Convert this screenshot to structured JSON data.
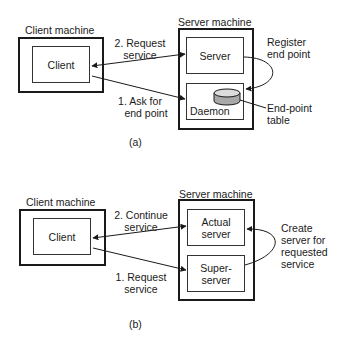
{
  "panel_a": {
    "caption": "(a)",
    "client_machine": {
      "label": "Client machine",
      "inner": "Client"
    },
    "server_machine": {
      "label": "Server machine",
      "top_box": "Server",
      "bottom_box": "Daemon"
    },
    "arrows": {
      "top_line1": "2. Request",
      "top_line2": "service",
      "bottom_line1": "1. Ask for",
      "bottom_line2": "end point"
    },
    "annotations": {
      "register_line1": "Register",
      "register_line2": "end point",
      "table_line1": "End-point",
      "table_line2": "table"
    }
  },
  "panel_b": {
    "caption": "(b)",
    "client_machine": {
      "label": "Client machine",
      "inner": "Client"
    },
    "server_machine": {
      "label": "Server machine",
      "top_line1": "Actual",
      "top_line2": "server",
      "bottom_line1": "Super-",
      "bottom_line2": "server"
    },
    "arrows": {
      "top_line1": "2. Continue",
      "top_line2": "service",
      "bottom_line1": "1. Request",
      "bottom_line2": "service"
    },
    "annotations": {
      "create_line1": "Create",
      "create_line2": "server for",
      "create_line3": "requested",
      "create_line4": "service"
    }
  }
}
